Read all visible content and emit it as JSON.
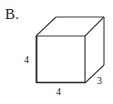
{
  "figure": {
    "item_label": "B.",
    "shape": "cube",
    "background_color": "#ffffff",
    "stroke_color": "#3a3a3a",
    "front_edge_color": "#262626",
    "dimensions": {
      "height_label": "4",
      "width_label": "4",
      "depth_label": "3"
    },
    "geometry": {
      "front_top_left": [
        36,
        36
      ],
      "front_top_right": [
        85,
        36
      ],
      "front_bottom_left": [
        36,
        83
      ],
      "front_bottom_right": [
        85,
        83
      ],
      "back_top_left": [
        56,
        17
      ],
      "back_top_right": [
        104,
        17
      ],
      "back_bottom_right": [
        104,
        65
      ]
    }
  }
}
